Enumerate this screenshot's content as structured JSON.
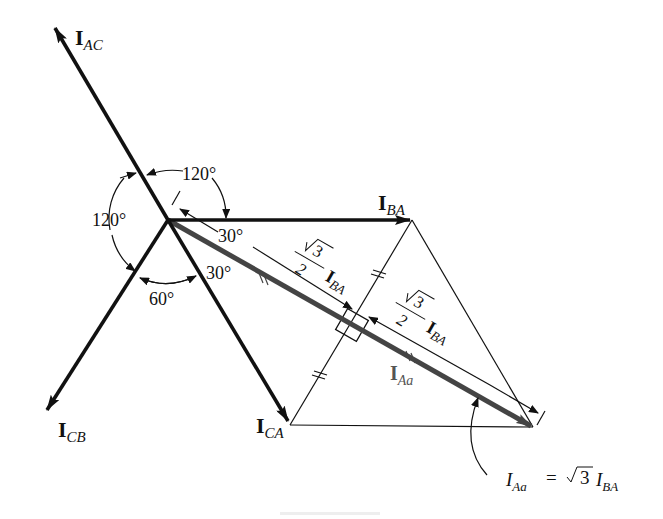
{
  "figure": {
    "type": "phasor-diagram",
    "colors": {
      "ink": "#111111",
      "line_current": "#444444",
      "background": "#ffffff"
    }
  },
  "phasors": {
    "I_AC": {
      "main": "I",
      "sub": "AC"
    },
    "I_BA": {
      "main": "I",
      "sub": "BA"
    },
    "I_CB": {
      "main": "I",
      "sub": "CB"
    },
    "I_CA": {
      "main": "I",
      "sub": "CA"
    },
    "I_Aa": {
      "main": "I",
      "sub": "Aa"
    }
  },
  "angles": {
    "top": "120°",
    "left": "120°",
    "bottom": "60°",
    "upper_30": "30°",
    "lower_30": "30°"
  },
  "half_length_label": {
    "radical": "3",
    "denominator": "2",
    "current_main": "I",
    "current_sub": "BA"
  },
  "equation": {
    "lhs_main": "I",
    "lhs_sub": "Aa",
    "equals": "=",
    "radical": "3",
    "rhs_main": "I",
    "rhs_sub": "BA"
  }
}
